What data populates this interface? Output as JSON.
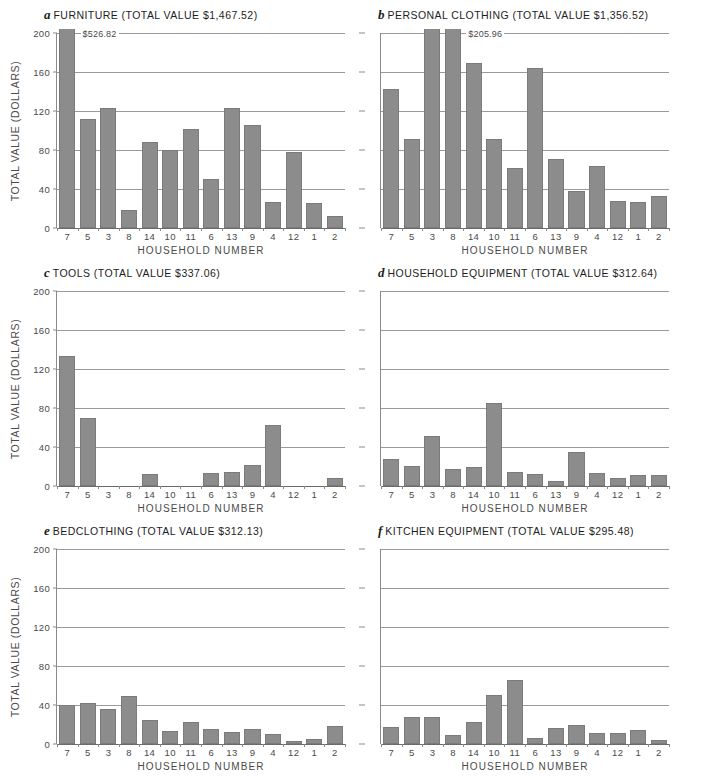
{
  "figure": {
    "axis_title_y": "TOTAL VALUE (DOLLARS)",
    "axis_title_x": "HOUSEHOLD NUMBER",
    "bar_color": "#8c8c8c",
    "grid_color": "#9a9a9a",
    "categories": [
      "7",
      "5",
      "3",
      "8",
      "14",
      "10",
      "11",
      "6",
      "13",
      "9",
      "4",
      "12",
      "1",
      "2"
    ],
    "yticks": [
      "0",
      "40",
      "80",
      "120",
      "160",
      "200"
    ]
  },
  "chart_data": [
    {
      "type": "bar",
      "panel": "a",
      "title": "FURNITURE (TOTAL VALUE $1,467.52)",
      "category_name": "FURNITURE",
      "total_value": "$1,467.52",
      "xlabel": "HOUSEHOLD NUMBER",
      "ylabel": "TOTAL VALUE (DOLLARS)",
      "ylim": [
        0,
        200
      ],
      "yticks": [
        0,
        40,
        80,
        120,
        160,
        200
      ],
      "grid": true,
      "legend": "none",
      "categories": [
        "7",
        "5",
        "3",
        "8",
        "14",
        "10",
        "11",
        "6",
        "13",
        "9",
        "4",
        "12",
        "1",
        "2"
      ],
      "values": [
        526.82,
        112,
        123,
        18,
        88,
        80,
        102,
        50,
        123,
        106,
        27,
        78,
        26,
        12
      ],
      "annotations": [
        {
          "category": "7",
          "text": "$526.82",
          "note": "bar exceeds axis maximum; actual value labeled"
        }
      ]
    },
    {
      "type": "bar",
      "panel": "b",
      "title": "PERSONAL CLOTHING (TOTAL VALUE $1,356.52)",
      "category_name": "PERSONAL CLOTHING",
      "total_value": "$1,356.52",
      "xlabel": "HOUSEHOLD NUMBER",
      "ylabel": "TOTAL VALUE (DOLLARS)",
      "ylim": [
        0,
        200
      ],
      "yticks": [
        0,
        40,
        80,
        120,
        160,
        200
      ],
      "grid": true,
      "legend": "none",
      "categories": [
        "7",
        "5",
        "3",
        "8",
        "14",
        "10",
        "11",
        "6",
        "13",
        "9",
        "4",
        "12",
        "1",
        "2"
      ],
      "values": [
        143,
        91,
        201,
        205.96,
        169,
        91,
        62,
        164,
        71,
        38,
        64,
        28,
        27,
        33
      ],
      "annotations": [
        {
          "category": "8",
          "text": "$205.96",
          "note": "tallest bar; actual value labeled"
        }
      ]
    },
    {
      "type": "bar",
      "panel": "c",
      "title": "TOOLS (TOTAL VALUE $337.06)",
      "category_name": "TOOLS",
      "total_value": "$337.06",
      "xlabel": "HOUSEHOLD NUMBER",
      "ylabel": "TOTAL VALUE (DOLLARS)",
      "ylim": [
        0,
        200
      ],
      "yticks": [
        0,
        40,
        80,
        120,
        160,
        200
      ],
      "grid": true,
      "legend": "none",
      "categories": [
        "7",
        "5",
        "3",
        "8",
        "14",
        "10",
        "11",
        "6",
        "13",
        "9",
        "4",
        "12",
        "1",
        "2"
      ],
      "values": [
        133,
        70,
        0,
        0,
        12,
        0,
        0,
        13,
        14,
        22,
        63,
        0,
        0,
        8
      ],
      "annotations": []
    },
    {
      "type": "bar",
      "panel": "d",
      "title": "HOUSEHOLD EQUIPMENT (TOTAL VALUE $312.64)",
      "category_name": "HOUSEHOLD EQUIPMENT",
      "total_value": "$312.64",
      "xlabel": "HOUSEHOLD NUMBER",
      "ylabel": "TOTAL VALUE (DOLLARS)",
      "ylim": [
        0,
        200
      ],
      "yticks": [
        0,
        40,
        80,
        120,
        160,
        200
      ],
      "grid": true,
      "legend": "none",
      "categories": [
        "7",
        "5",
        "3",
        "8",
        "14",
        "10",
        "11",
        "6",
        "13",
        "9",
        "4",
        "12",
        "1",
        "2"
      ],
      "values": [
        28,
        21,
        51,
        17,
        20,
        85,
        14,
        12,
        5,
        35,
        13,
        8,
        11,
        11
      ],
      "annotations": []
    },
    {
      "type": "bar",
      "panel": "e",
      "title": "BEDCLOTHING (TOTAL VALUE $312.13)",
      "category_name": "BEDCLOTHING",
      "total_value": "$312.13",
      "xlabel": "HOUSEHOLD NUMBER",
      "ylabel": "TOTAL VALUE (DOLLARS)",
      "ylim": [
        0,
        200
      ],
      "yticks": [
        0,
        40,
        80,
        120,
        160,
        200
      ],
      "grid": true,
      "legend": "none",
      "categories": [
        "7",
        "5",
        "3",
        "8",
        "14",
        "10",
        "11",
        "6",
        "13",
        "9",
        "4",
        "12",
        "1",
        "2"
      ],
      "values": [
        40,
        42,
        36,
        49,
        25,
        13,
        23,
        15,
        12,
        15,
        10,
        3,
        5,
        18
      ],
      "annotations": []
    },
    {
      "type": "bar",
      "panel": "f",
      "title": "KITCHEN EQUIPMENT (TOTAL VALUE $295.48)",
      "category_name": "KITCHEN EQUIPMENT",
      "total_value": "$295.48",
      "xlabel": "HOUSEHOLD NUMBER",
      "ylabel": "TOTAL VALUE (DOLLARS)",
      "ylim": [
        0,
        200
      ],
      "yticks": [
        0,
        40,
        80,
        120,
        160,
        200
      ],
      "grid": true,
      "legend": "none",
      "categories": [
        "7",
        "5",
        "3",
        "8",
        "14",
        "10",
        "11",
        "6",
        "13",
        "9",
        "4",
        "12",
        "1",
        "2"
      ],
      "values": [
        17,
        28,
        28,
        9,
        23,
        50,
        66,
        6,
        16,
        19,
        11,
        11,
        14,
        4
      ],
      "annotations": []
    }
  ]
}
